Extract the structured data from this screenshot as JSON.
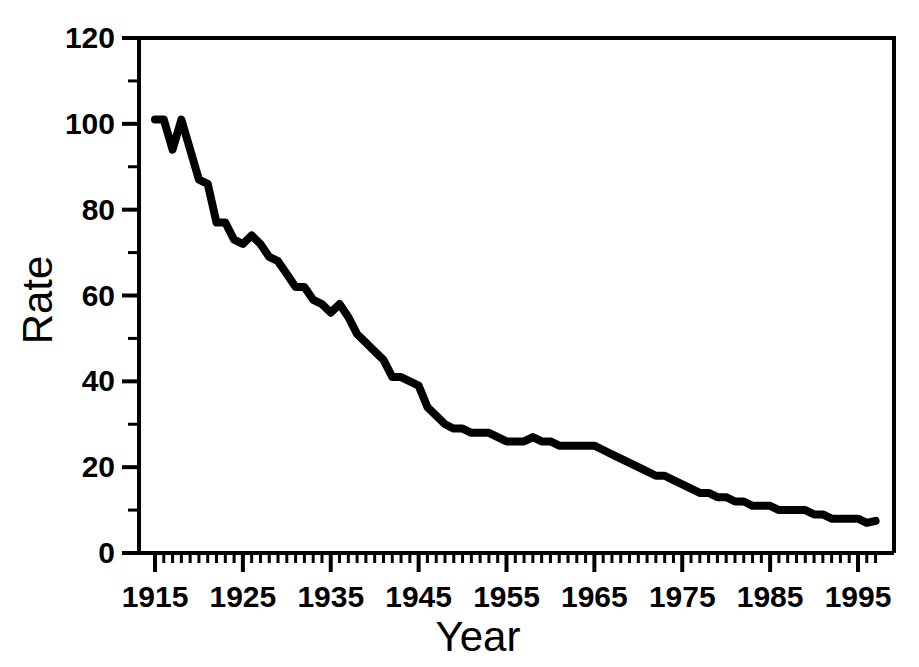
{
  "chart_data": {
    "type": "line",
    "title": "",
    "xlabel": "Year",
    "ylabel": "Rate",
    "xlim": [
      1915,
      1997
    ],
    "ylim": [
      0,
      120
    ],
    "grid": false,
    "legend": null,
    "x_major_ticks": [
      1915,
      1925,
      1935,
      1945,
      1955,
      1965,
      1975,
      1985,
      1995
    ],
    "x_major_tick_labels": [
      "1915",
      "1925",
      "1935",
      "1945",
      "1955",
      "1965",
      "1975",
      "1985",
      "1995"
    ],
    "x_minor_tick_interval": 1,
    "y_major_ticks": [
      0,
      20,
      40,
      60,
      80,
      100,
      120
    ],
    "y_major_tick_labels": [
      "0",
      "20",
      "40",
      "60",
      "80",
      "100",
      "120"
    ],
    "y_minor_tick_interval": 10,
    "series": [
      {
        "name": "Rate",
        "color": "#000000",
        "x": [
          1915,
          1916,
          1917,
          1918,
          1919,
          1920,
          1921,
          1922,
          1923,
          1924,
          1925,
          1926,
          1927,
          1928,
          1929,
          1930,
          1931,
          1932,
          1933,
          1934,
          1935,
          1936,
          1937,
          1938,
          1939,
          1940,
          1941,
          1942,
          1943,
          1944,
          1945,
          1946,
          1947,
          1948,
          1949,
          1950,
          1951,
          1952,
          1953,
          1954,
          1955,
          1956,
          1957,
          1958,
          1959,
          1960,
          1961,
          1962,
          1963,
          1964,
          1965,
          1966,
          1967,
          1968,
          1969,
          1970,
          1971,
          1972,
          1973,
          1974,
          1975,
          1976,
          1977,
          1978,
          1979,
          1980,
          1981,
          1982,
          1983,
          1984,
          1985,
          1986,
          1987,
          1988,
          1989,
          1990,
          1991,
          1992,
          1993,
          1994,
          1995,
          1996,
          1997
        ],
        "y": [
          101,
          101,
          94,
          101,
          94,
          87,
          86,
          77,
          77,
          73,
          72,
          74,
          72,
          69,
          68,
          65,
          62,
          62,
          59,
          58,
          56,
          58,
          55,
          51,
          49,
          47,
          45,
          41,
          41,
          40,
          39,
          34,
          32,
          30,
          29,
          29,
          28,
          28,
          28,
          27,
          26,
          26,
          26,
          27,
          26,
          26,
          25,
          25,
          25,
          25,
          25,
          24,
          23,
          22,
          21,
          20,
          19,
          18,
          18,
          17,
          16,
          15,
          14,
          14,
          13,
          13,
          12,
          12,
          11,
          11,
          11,
          10,
          10,
          10,
          10,
          9,
          9,
          8,
          8,
          8,
          8,
          7,
          7.5
        ]
      }
    ]
  },
  "axes": {
    "y_label": "Rate",
    "x_label": "Year"
  }
}
